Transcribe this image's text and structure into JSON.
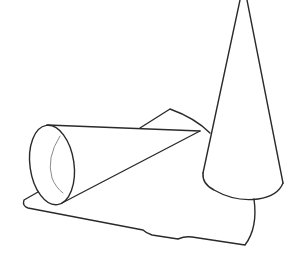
{
  "figure": {
    "background_color": "#ffffff",
    "stroke_color": "#2a2a2a",
    "inner_stroke_color": "#8a8a8a",
    "stroke_width": 1.4,
    "objects": [
      {
        "name": "upright-cone",
        "label": ""
      },
      {
        "name": "lying-cone",
        "label": ""
      },
      {
        "name": "shadow",
        "label": ""
      }
    ]
  }
}
